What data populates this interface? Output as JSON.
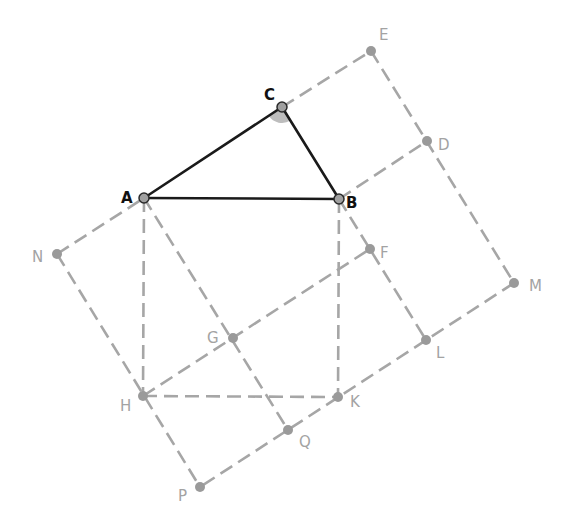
{
  "figure": {
    "triangle": [
      "A",
      "B",
      "C"
    ],
    "angle_mark_at": "C",
    "colors": {
      "triangle": "#1a1a1a",
      "construction": "#a6a6a6",
      "angle_fill": "#bdbdbd",
      "label_main": "#111111",
      "label_construction": "#a3a3a3"
    },
    "points": [
      {
        "id": "A",
        "x": 144,
        "y": 198,
        "main": true,
        "label": "A",
        "lx": 121,
        "ly": 203
      },
      {
        "id": "B",
        "x": 339,
        "y": 199,
        "main": true,
        "label": "B",
        "lx": 346,
        "ly": 208
      },
      {
        "id": "C",
        "x": 282,
        "y": 107,
        "main": true,
        "label": "C",
        "lx": 264,
        "ly": 100
      },
      {
        "id": "E",
        "x": 371,
        "y": 51,
        "main": false,
        "label": "E",
        "lx": 379,
        "ly": 40
      },
      {
        "id": "D",
        "x": 427,
        "y": 141,
        "main": false,
        "label": "D",
        "lx": 438,
        "ly": 150
      },
      {
        "id": "M",
        "x": 514,
        "y": 283,
        "main": false,
        "label": "M",
        "lx": 529,
        "ly": 291
      },
      {
        "id": "F",
        "x": 370,
        "y": 249,
        "main": false,
        "label": "F",
        "lx": 380,
        "ly": 258
      },
      {
        "id": "L",
        "x": 426,
        "y": 340,
        "main": false,
        "label": "L",
        "lx": 436,
        "ly": 358
      },
      {
        "id": "K",
        "x": 338,
        "y": 397,
        "main": false,
        "label": "K",
        "lx": 350,
        "ly": 407
      },
      {
        "id": "Q",
        "x": 288,
        "y": 430,
        "main": false,
        "label": "Q",
        "lx": 299,
        "ly": 447
      },
      {
        "id": "P",
        "x": 200,
        "y": 487,
        "main": false,
        "label": "P",
        "lx": 178,
        "ly": 501
      },
      {
        "id": "H",
        "x": 143,
        "y": 396,
        "main": false,
        "label": "H",
        "lx": 120,
        "ly": 411
      },
      {
        "id": "G",
        "x": 233,
        "y": 338,
        "main": false,
        "label": "G",
        "lx": 207,
        "ly": 343
      },
      {
        "id": "N",
        "x": 57,
        "y": 254,
        "main": false,
        "label": "N",
        "lx": 32,
        "ly": 262
      }
    ],
    "solid_segments": [
      [
        "A",
        "B"
      ],
      [
        "B",
        "C"
      ],
      [
        "C",
        "A"
      ]
    ],
    "dashed_segments": [
      [
        "N",
        "A"
      ],
      [
        "C",
        "E"
      ],
      [
        "E",
        "M"
      ],
      [
        "B",
        "D"
      ],
      [
        "B",
        "L"
      ],
      [
        "M",
        "P"
      ],
      [
        "N",
        "P"
      ],
      [
        "A",
        "Q"
      ],
      [
        "H",
        "F"
      ],
      [
        "A",
        "H"
      ],
      [
        "B",
        "K"
      ],
      [
        "H",
        "K"
      ]
    ]
  }
}
